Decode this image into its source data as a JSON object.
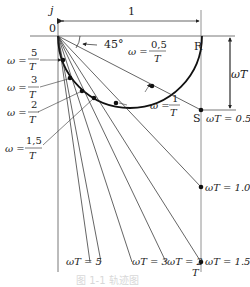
{
  "axes": {
    "imag_label": "j",
    "origin_label": "0",
    "real_point_label": "R",
    "unit_length_label": "1",
    "vertical_dim_label": "ωT",
    "angle_label": "45°"
  },
  "points": {
    "S_label": "S",
    "wT_05": "ωT = 0.5",
    "wT_10": "ωT = 1.0",
    "wT_15": "ωT = 1.5",
    "wT_2": "ωT = 2",
    "wT_3": "ωT = 3",
    "wT_5": "ωT = 5",
    "T_label": "T"
  },
  "omega_labels": [
    {
      "prefix": "ω =",
      "num": "5",
      "den": "T"
    },
    {
      "prefix": "ω =",
      "num": "3",
      "den": "T"
    },
    {
      "prefix": "ω =",
      "num": "2",
      "den": "T"
    },
    {
      "prefix": "ω =",
      "num": "1,5",
      "den": "T"
    },
    {
      "prefix": "ω =",
      "num": "1",
      "den": "T"
    },
    {
      "prefix": "ω =",
      "num": "0,5",
      "den": "T"
    }
  ],
  "caption": "图 1-1   轨迹图"
}
